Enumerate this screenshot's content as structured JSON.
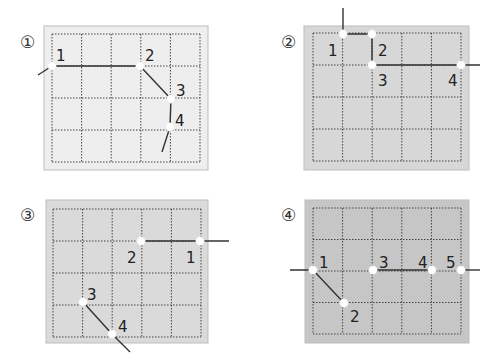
{
  "diagram": {
    "grid": {
      "cols": 5,
      "rows": 4
    },
    "panels": [
      {
        "id": "panel-1",
        "label": "①",
        "fill": "#eeeeee",
        "box": {
          "x": 44,
          "y": 26,
          "w": 164,
          "h": 144
        },
        "grid_origin": {
          "x": 52,
          "y": 34
        },
        "cell": {
          "w": 29.6,
          "h": 32
        },
        "path": [
          [
            38,
            75
          ],
          [
            52,
            66
          ],
          [
            140,
            66
          ],
          [
            171,
            99
          ],
          [
            170,
            127
          ],
          [
            162,
            152
          ]
        ],
        "points": [
          {
            "label": "1",
            "x": 52,
            "y": 66,
            "tx": 56,
            "ty": 61
          },
          {
            "label": "2",
            "x": 140,
            "y": 66,
            "tx": 145,
            "ty": 61
          },
          {
            "label": "3",
            "x": 171,
            "y": 99,
            "tx": 176,
            "ty": 96
          },
          {
            "label": "4",
            "x": 170,
            "y": 127,
            "tx": 175,
            "ty": 126
          }
        ]
      },
      {
        "id": "panel-2",
        "label": "②",
        "fill": "#d7d7d7",
        "box": {
          "x": 304,
          "y": 26,
          "w": 165,
          "h": 144
        },
        "grid_origin": {
          "x": 313,
          "y": 33
        },
        "cell": {
          "w": 29.6,
          "h": 32
        },
        "path": [
          [
            343,
            8
          ],
          [
            343,
            34
          ],
          [
            372,
            34
          ],
          [
            372,
            65
          ],
          [
            461,
            65
          ],
          [
            480,
            65
          ]
        ],
        "points": [
          {
            "label": "1",
            "x": 343,
            "y": 34,
            "tx": 328,
            "ty": 56
          },
          {
            "label": "2",
            "x": 372,
            "y": 34,
            "tx": 378,
            "ty": 56
          },
          {
            "label": "3",
            "x": 372,
            "y": 65,
            "tx": 378,
            "ty": 86
          },
          {
            "label": "4",
            "x": 461,
            "y": 65,
            "tx": 448,
            "ty": 86
          }
        ]
      },
      {
        "id": "panel-3",
        "label": "③",
        "fill": "#dadada",
        "box": {
          "x": 46,
          "y": 200,
          "w": 162,
          "h": 143
        },
        "grid_origin": {
          "x": 53,
          "y": 209
        },
        "cell": {
          "w": 29.6,
          "h": 32
        },
        "path": [
          [
            229,
            241
          ],
          [
            200,
            241
          ],
          [
            141,
            241
          ]
        ],
        "path2": [
          [
            83,
            302
          ],
          [
            112,
            334
          ],
          [
            130,
            352
          ]
        ],
        "points": [
          {
            "label": "1",
            "x": 200,
            "y": 241,
            "tx": 186,
            "ty": 263
          },
          {
            "label": "2",
            "x": 141,
            "y": 241,
            "tx": 127,
            "ty": 263
          },
          {
            "label": "3",
            "x": 83,
            "y": 302,
            "tx": 87,
            "ty": 300
          },
          {
            "label": "4",
            "x": 112,
            "y": 334,
            "tx": 118,
            "ty": 332
          }
        ]
      },
      {
        "id": "panel-4",
        "label": "④",
        "fill": "#c6c6c6",
        "box": {
          "x": 305,
          "y": 200,
          "w": 164,
          "h": 143
        },
        "grid_origin": {
          "x": 313,
          "y": 208
        },
        "cell": {
          "w": 29.6,
          "h": 31.5
        },
        "path": [
          [
            290,
            270
          ],
          [
            313,
            270
          ],
          [
            344,
            303
          ]
        ],
        "path2": [
          [
            373,
            270
          ],
          [
            432,
            270
          ]
        ],
        "path3": [
          [
            461,
            270
          ],
          [
            480,
            270
          ]
        ],
        "points": [
          {
            "label": "1",
            "x": 313,
            "y": 270,
            "tx": 319,
            "ty": 268
          },
          {
            "label": "2",
            "x": 344,
            "y": 303,
            "tx": 350,
            "ty": 322
          },
          {
            "label": "3",
            "x": 373,
            "y": 270,
            "tx": 379,
            "ty": 268
          },
          {
            "label": "4",
            "x": 432,
            "y": 270,
            "tx": 418,
            "ty": 268
          },
          {
            "label": "5",
            "x": 461,
            "y": 270,
            "tx": 446,
            "ty": 268
          }
        ]
      }
    ]
  }
}
